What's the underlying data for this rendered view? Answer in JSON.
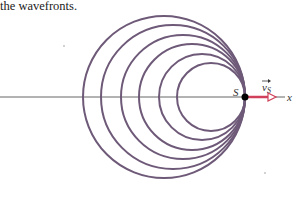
{
  "caption": "the wavefronts.",
  "diagram": {
    "source_label": "S",
    "velocity_label": "v",
    "velocity_subscript": "S",
    "axis_label": "x",
    "colors": {
      "wavefront": "#6e5a78",
      "velocity": "#d0405a",
      "axis": "#555555"
    },
    "source": {
      "x": 245,
      "y": 97
    },
    "wavefront_radii": [
      81,
      72,
      62,
      53,
      43,
      34
    ]
  }
}
